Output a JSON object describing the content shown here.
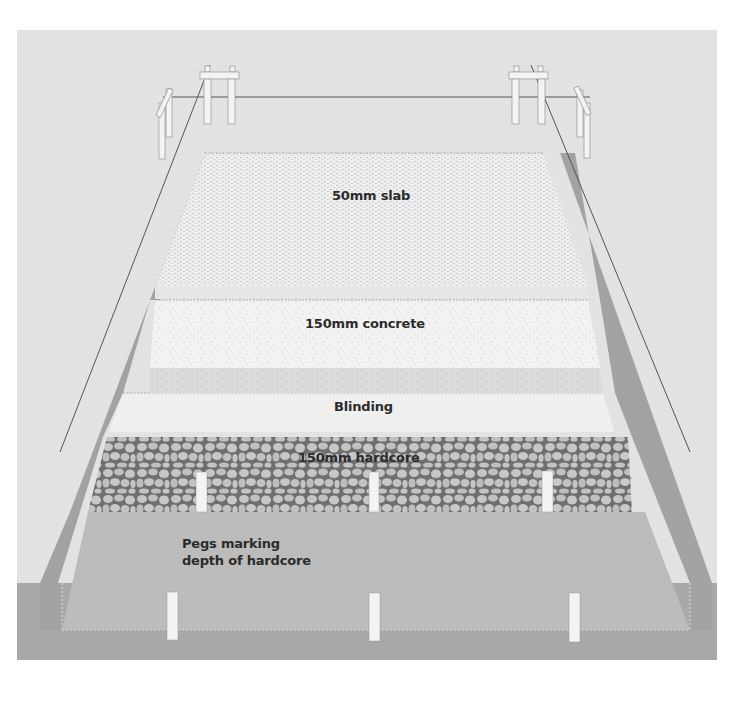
{
  "diagram": {
    "type": "cross-section illustration",
    "colors": {
      "page_background": "#ffffff",
      "panel_background": "#e3e3e3",
      "ground": "#a9a9a9",
      "trench_slope": "#a3a3a3",
      "trench_floor": "#bcbcbc",
      "slab": "#ededed",
      "concrete": "#f2f2f2",
      "blinding": "#f0f0f0",
      "hardcore_fill": "#c4c4c4",
      "hardcore_lines": "#6f6f6f",
      "string_line": "#555555",
      "peg": "#f4f4f4",
      "text": "#2b2b2b"
    },
    "layers": [
      {
        "id": "slab",
        "label": "50mm slab",
        "order": 1
      },
      {
        "id": "concrete",
        "label": "150mm concrete",
        "order": 2
      },
      {
        "id": "blinding",
        "label": "Blinding",
        "order": 3
      },
      {
        "id": "hardcore",
        "label": "150mm hardcore",
        "order": 4
      }
    ],
    "annotations": {
      "pegs_label": "Pegs marking\ndepth of hardcore"
    },
    "elements": {
      "profile_boards": 2,
      "corner_pegs": 2,
      "depth_pegs_in_hardcore": 3,
      "depth_pegs_on_floor": 3,
      "string_lines": 3
    }
  }
}
